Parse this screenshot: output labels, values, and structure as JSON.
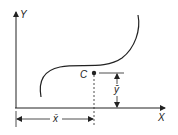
{
  "diagram": {
    "axis_labels": {
      "y": "Y",
      "x": "X"
    },
    "point_label": "C",
    "xbar_label": "x̄",
    "ybar_label": "ȳ",
    "colors": {
      "ink": "#222222",
      "background": "#ffffff"
    }
  }
}
